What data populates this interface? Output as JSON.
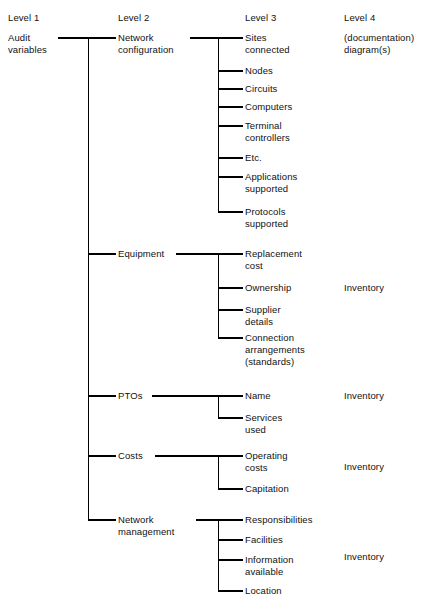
{
  "diagram": {
    "type": "hierarchy-tree",
    "line_color": "#000000",
    "background_color": "#ffffff",
    "columns": [
      {
        "id": "level1",
        "header": "Level 1"
      },
      {
        "id": "level2",
        "header": "Level 2"
      },
      {
        "id": "level3",
        "header": "Level 3"
      },
      {
        "id": "level4",
        "header": "Level 4"
      }
    ],
    "root": {
      "label": "Audit\nvariables",
      "level": 1
    },
    "level4_header_note": "(documentation)\ndiagram(s)",
    "branches": [
      {
        "label": "Network\nconfiguration",
        "level4": "",
        "children": [
          "Sites\nconnected",
          "Nodes",
          "Circuits",
          "Computers",
          "Terminal\ncontrollers",
          "Etc.",
          "Applications\nsupported",
          "Protocols\nsupported"
        ]
      },
      {
        "label": "Equipment",
        "level4": "Inventory",
        "children": [
          "Replacement\ncost",
          "Ownership",
          "Supplier\ndetails",
          "Connection\narrangements\n(standards)"
        ]
      },
      {
        "label": "PTOs",
        "level4": "Inventory",
        "children": [
          "Name",
          "Services\nused"
        ]
      },
      {
        "label": "Costs",
        "level4": "Inventory",
        "children": [
          "Operating\ncosts",
          "Capitation"
        ]
      },
      {
        "label": "Network\nmanagement",
        "level4": "Inventory",
        "children": [
          "Responsibilities",
          "Facilities",
          "Information\navailable",
          "Location"
        ]
      }
    ]
  }
}
